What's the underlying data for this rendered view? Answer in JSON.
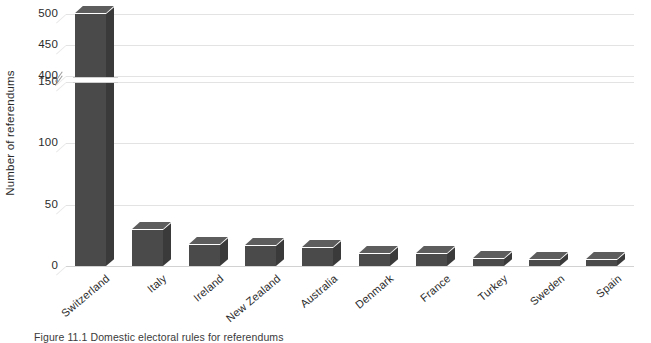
{
  "chart_data": {
    "type": "bar",
    "title": "",
    "subtitle": "",
    "xlabel": "",
    "ylabel": "Number of referendums",
    "categories": [
      "Switzerland",
      "Italy",
      "Ireland",
      "New Zealand",
      "Australia",
      "Denmark",
      "France",
      "Turkey",
      "Sweden",
      "Spain"
    ],
    "values": [
      500,
      29,
      17,
      16,
      15,
      10,
      10,
      6,
      5,
      5
    ],
    "ylim": [
      0,
      500
    ],
    "grid": true,
    "legend": "none",
    "axis_break": {
      "present": true,
      "marker": "//",
      "lower_segment": [
        0,
        150
      ],
      "upper_segment": [
        400,
        500
      ],
      "note": "y-axis is broken between 150 and 400"
    },
    "y_ticks": [
      {
        "label": "500",
        "value": 500
      },
      {
        "label": "450",
        "value": 450
      },
      {
        "label": "400",
        "value": 400
      },
      {
        "label": "150",
        "value": 150
      },
      {
        "label": "100",
        "value": 100
      },
      {
        "label": "50",
        "value": 50
      },
      {
        "label": "0",
        "value": 0
      }
    ],
    "series": [
      {
        "name": "Number of referendums",
        "color": "#4a4a4a",
        "values": [
          500,
          29,
          17,
          16,
          15,
          10,
          10,
          6,
          5,
          5
        ]
      }
    ]
  },
  "colors": {
    "bar_front": "#4a4a4a",
    "bar_side": "#3a3a3a",
    "bar_top": "#5d5d5d",
    "gridline": "#e3e3e3",
    "text": "#2b2b2b",
    "background": "#ffffff"
  },
  "caption": {
    "label": "Figure 11.1",
    "text": "Figure 11.1 Domestic electoral rules for referendums"
  }
}
